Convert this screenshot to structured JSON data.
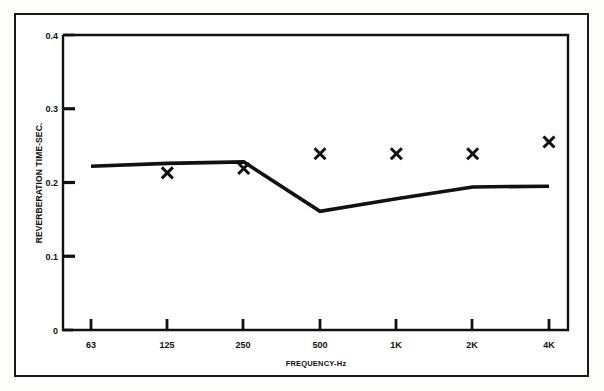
{
  "figure": {
    "frame_color": "#1a1a1a",
    "background": "#ffffff",
    "line_color": "#111111",
    "marker_color": "#111111"
  },
  "chart_data": {
    "type": "line",
    "title": "",
    "xlabel": "FREQUENCY-Hz",
    "ylabel": "REVERBERATION TIME-SEC.",
    "categories": [
      "63",
      "125",
      "250",
      "500",
      "1K",
      "2K",
      "4K"
    ],
    "ylim": [
      0,
      0.4
    ],
    "yticks": [
      0,
      0.1,
      0.2,
      0.3,
      0.4
    ],
    "ytick_labels": [
      "0",
      "0.1",
      "0.2",
      "0.3",
      "0.4"
    ],
    "grid": false,
    "legend": "none",
    "series": [
      {
        "name": "measured-curve",
        "style": "line",
        "values": [
          0.222,
          0.226,
          0.228,
          0.161,
          0.178,
          0.194,
          0.195
        ]
      },
      {
        "name": "predicted-points",
        "style": "x-marker",
        "values": [
          null,
          0.213,
          0.219,
          0.239,
          0.239,
          0.239,
          0.255
        ]
      }
    ]
  }
}
